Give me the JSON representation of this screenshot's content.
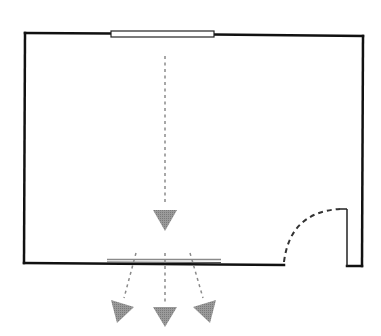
{
  "diagram": {
    "type": "floor-plan",
    "colors": {
      "wall": "#111111",
      "window_fill": "#ffffff",
      "window_stroke": "#222222",
      "bottom_window": "#777777",
      "arrow": "#8a8a8a",
      "door_swing": "#333333",
      "background": "#ffffff"
    },
    "elements": {
      "walls": "room-walls",
      "top_window": "window-top",
      "bottom_window": "window-bottom",
      "door": "door-with-swing-arc",
      "incoming_arrow": "arrow-down-center",
      "outgoing_arrows": [
        "arrow-out-left",
        "arrow-out-center",
        "arrow-out-right"
      ]
    }
  }
}
